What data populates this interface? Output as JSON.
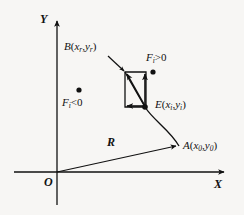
{
  "figure": {
    "type": "coordinate-diagram",
    "background_color": "#f7f6f4",
    "stroke_color": "#111111",
    "width": 244,
    "height": 215
  },
  "axes": {
    "y_label": "Y",
    "x_label": "X",
    "origin_label": "O",
    "origin_px": [
      57,
      172
    ],
    "x_axis_end_px": [
      226,
      172
    ],
    "y_axis_top_px": [
      57,
      18
    ]
  },
  "labels": {
    "point_b": {
      "name": "B",
      "coord_x": "x",
      "coord_x_sub": "r",
      "coord_y": "y",
      "coord_y_sub": "r",
      "text": "B(xr ,yr)"
    },
    "point_e": {
      "name": "E",
      "coord_x": "x",
      "coord_x_sub": "i",
      "coord_y": "y",
      "coord_y_sub": "i",
      "text": "E(xi ,yi)"
    },
    "point_a": {
      "name": "A",
      "coord_x": "x",
      "coord_x_sub": "0",
      "coord_y": "y",
      "coord_y_sub": "0",
      "text": "A(x0 ,y0)"
    },
    "force_positive": {
      "symbol": "F",
      "subscript": "i",
      "relation": ">0",
      "text": "Fi>0"
    },
    "force_negative": {
      "symbol": "F",
      "subscript": "i",
      "relation": "<0",
      "text": "Fi<0"
    },
    "radius_vector": {
      "symbol": "R",
      "text": "R"
    }
  },
  "markers": {
    "dot_force_positive_px": [
      153,
      72
    ],
    "dot_force_negative_px": [
      79,
      90
    ],
    "dot_point_e_px": [
      144,
      106
    ],
    "dot_parallelogram_corner_px": [
      152,
      72
    ]
  },
  "vectors": {
    "r_vector": {
      "from": [
        57,
        172
      ],
      "to": [
        178,
        145
      ],
      "arrow": "end"
    },
    "parallelogram_up": {
      "from": [
        144,
        106
      ],
      "to": [
        144,
        71
      ],
      "arrow": "end"
    },
    "parallelogram_left": {
      "from": [
        144,
        106
      ],
      "to": [
        124,
        106
      ],
      "arrow": "end"
    },
    "parallelogram_diagonal": {
      "from": [
        144,
        106
      ],
      "to": [
        124,
        71
      ],
      "arrow": "end"
    },
    "b_leader": {
      "from": [
        110,
        57
      ],
      "to": [
        126,
        72
      ],
      "arrow": "end"
    }
  },
  "curve": {
    "name": "trajectory",
    "description": "arc from A through E toward B",
    "path": "M 178,145 C 168,128 152,118 144,106 C 136,92 130,82 124,71"
  }
}
